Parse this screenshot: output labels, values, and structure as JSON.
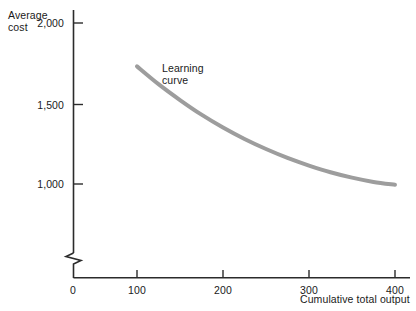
{
  "chart_data": {
    "type": "line",
    "title": "",
    "subtitle": "",
    "xlabel": "Cumulative total output",
    "ylabel": "Average cost",
    "ylabel_line1": "Average",
    "ylabel_line2": "cost",
    "xlim": [
      0,
      420
    ],
    "ylim": [
      800,
      2050
    ],
    "y_axis_break": true,
    "y_axis_break_note": "zigzag break between 0 and lowest plotted value",
    "grid": false,
    "legend": null,
    "x_ticks": [
      {
        "value": 0,
        "label": "0"
      },
      {
        "value": 100,
        "label": "100"
      },
      {
        "value": 200,
        "label": "200"
      },
      {
        "value": 300,
        "label": "300"
      },
      {
        "value": 400,
        "label": "400"
      }
    ],
    "y_ticks": [
      {
        "value": 1000,
        "label": "1,000"
      },
      {
        "value": 1500,
        "label": "1,500"
      },
      {
        "value": 2000,
        "label": "2,000"
      }
    ],
    "series": [
      {
        "name": "Learning curve",
        "color": "#9d9d9d",
        "line_width": 4,
        "x": [
          100,
          125,
          150,
          175,
          200,
          225,
          250,
          275,
          300,
          325,
          350,
          375,
          400
        ],
        "values": [
          1740,
          1628,
          1528,
          1436,
          1355,
          1283,
          1220,
          1164,
          1116,
          1074,
          1040,
          1013,
          995
        ]
      }
    ],
    "annotations": [
      {
        "text": "Learning curve",
        "line1": "Learning",
        "line2": "curve",
        "x": 145,
        "y": 1760
      }
    ]
  },
  "colors": {
    "background": "#ffffff",
    "axis": "#2b2b2b",
    "text": "#1a1a1a",
    "curve": "#9d9d9d"
  }
}
